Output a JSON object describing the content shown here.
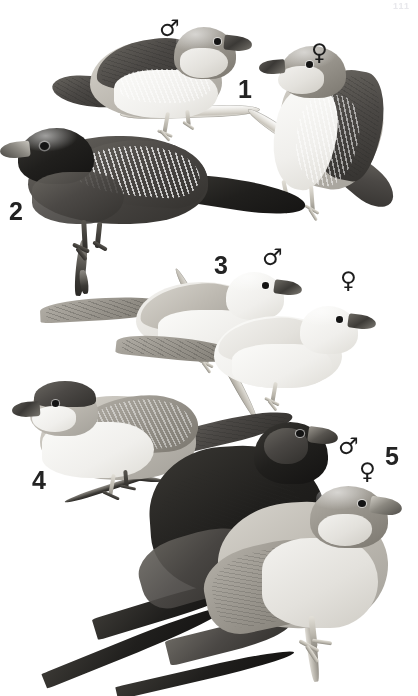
{
  "plate": {
    "kind": "field-guide-plate",
    "background_color": "#ffffff",
    "ink_color": "#232323",
    "width": 418,
    "height": 696,
    "corner_mark": "111"
  },
  "labels": [
    {
      "id": "num-1",
      "text": "1",
      "kind": "species-number",
      "x": 238,
      "y": 77
    },
    {
      "id": "num-2",
      "text": "2",
      "kind": "species-number",
      "x": 9,
      "y": 199
    },
    {
      "id": "num-3",
      "text": "3",
      "kind": "species-number",
      "x": 214,
      "y": 253
    },
    {
      "id": "num-4",
      "text": "4",
      "kind": "species-number",
      "x": 32,
      "y": 468
    },
    {
      "id": "num-5",
      "text": "5",
      "kind": "species-number",
      "x": 385,
      "y": 444
    }
  ],
  "sex_symbols": [
    {
      "id": "sex-1-male",
      "text": "♂",
      "species": "1",
      "sex": "male",
      "x": 159,
      "y": 17
    },
    {
      "id": "sex-1-female",
      "text": "♀",
      "species": "1",
      "sex": "female",
      "x": 311,
      "y": 41
    },
    {
      "id": "sex-3-male",
      "text": "♂",
      "species": "3",
      "sex": "male",
      "x": 262,
      "y": 246
    },
    {
      "id": "sex-3-female",
      "text": "♀",
      "species": "3",
      "sex": "female",
      "x": 340,
      "y": 269
    },
    {
      "id": "sex-5-male",
      "text": "♂",
      "species": "5",
      "sex": "male",
      "x": 338,
      "y": 435
    },
    {
      "id": "sex-5-female",
      "text": "♀",
      "species": "5",
      "sex": "female",
      "x": 359,
      "y": 460
    }
  ],
  "figures": [
    {
      "id": "fig-1-male",
      "species_number": "1",
      "sex": "male",
      "pose": "perched-facing-right",
      "tone": "dark-upperparts-pale-barred-breast",
      "perch": "pale-branch"
    },
    {
      "id": "fig-1-female",
      "species_number": "1",
      "sex": "female",
      "pose": "perched-facing-left-upright",
      "tone": "grey-crown-pale-barred-flanks",
      "perch": "pale-branch"
    },
    {
      "id": "fig-2",
      "species_number": "2",
      "sex": "unmarked",
      "pose": "perched-facing-left-long-tail",
      "tone": "black-hooded-dark-barred-wings",
      "perch": "dark-twig"
    },
    {
      "id": "fig-3-male",
      "species_number": "3",
      "sex": "male",
      "pose": "perched-facing-right-pointed-tail",
      "tone": "very-pale-grey",
      "perch": "pale-diagonal-branch"
    },
    {
      "id": "fig-3-female",
      "species_number": "3",
      "sex": "female",
      "pose": "perched-facing-right-pointed-tail",
      "tone": "near-white",
      "perch": "pale-diagonal-branch"
    },
    {
      "id": "fig-4",
      "species_number": "4",
      "sex": "unmarked",
      "pose": "perched-facing-left-pointed-tail",
      "tone": "dark-cap-pale-belly-vermiculated-wings",
      "perch": "dark-twig"
    },
    {
      "id": "fig-5-male",
      "species_number": "5",
      "sex": "male",
      "pose": "perched-facing-right-very-long-pin-tail",
      "tone": "blackish",
      "perch": "none"
    },
    {
      "id": "fig-5-female",
      "species_number": "5",
      "sex": "female",
      "pose": "perched-facing-right-long-pin-tail",
      "tone": "mid-grey-pale-underparts",
      "perch": "dark-twig"
    }
  ]
}
